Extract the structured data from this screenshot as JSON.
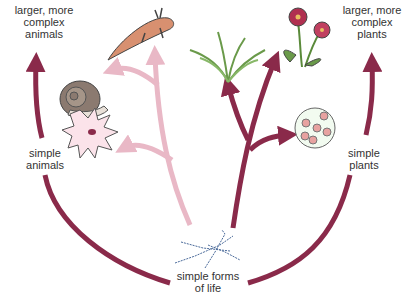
{
  "labels": {
    "top_left": [
      "larger, more",
      "complex",
      "animals"
    ],
    "top_right": [
      "larger, more",
      "complex",
      "plants"
    ],
    "mid_left": [
      "simple",
      "animals"
    ],
    "mid_right": [
      "simple",
      "plants"
    ],
    "bottom": [
      "simple forms",
      "of life"
    ]
  },
  "organisms": {
    "snail": "snail",
    "newt": "newt",
    "amoeba": "amoeba",
    "fern": "fern",
    "flower": "flowering plant",
    "algae": "algae cell",
    "bacteria": "chain bacteria"
  },
  "colors": {
    "outer_arrow": "#8a2a4a",
    "animal_tree": "#e9b8c6",
    "plant_tree": "#8a2a4a",
    "fern": "#6a9a4a",
    "flower": "#b03050"
  }
}
